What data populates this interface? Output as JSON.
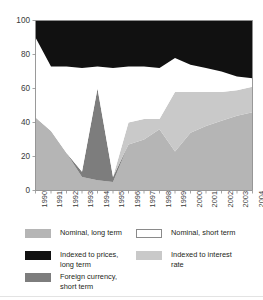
{
  "header": {
    "clipped_text": "Per cent"
  },
  "chart_data": {
    "type": "area",
    "stacked": true,
    "title": "",
    "xlabel": "",
    "ylabel": "",
    "ylim": [
      0,
      100
    ],
    "yticks": [
      0,
      20,
      40,
      60,
      80,
      100
    ],
    "grid": false,
    "legend_position": "bottom",
    "categories": [
      "1990",
      "1991",
      "1992",
      "1993",
      "1994",
      "1995",
      "1996",
      "1997",
      "1998",
      "1999",
      "2000",
      "2001",
      "2002",
      "2003",
      "2004"
    ],
    "series": [
      {
        "name": "Nominal, long term",
        "color": "#b5b5b5",
        "values": [
          43,
          35,
          22,
          8,
          6,
          5,
          27,
          30,
          36,
          23,
          34,
          38,
          41,
          44,
          46
        ]
      },
      {
        "name": "Foreign currency, short term",
        "color": "#7d7d7d",
        "values": [
          0,
          0,
          0,
          3,
          54,
          3,
          0,
          0,
          0,
          0,
          0,
          0,
          0,
          0,
          0
        ]
      },
      {
        "name": "Indexed to interest rate",
        "color": "#c9c9c9",
        "values": [
          0,
          0,
          0,
          0,
          0,
          0,
          13,
          12,
          6,
          35,
          24,
          20,
          17,
          15,
          15
        ]
      },
      {
        "name": "Nominal, short term",
        "color": "#ffffff",
        "values": [
          47,
          38,
          51,
          61,
          13,
          64,
          33,
          31,
          30,
          20,
          16,
          14,
          12,
          8,
          5
        ]
      },
      {
        "name": "Indexed to prices, long term",
        "color": "#111111",
        "values": [
          10,
          27,
          27,
          28,
          27,
          28,
          27,
          27,
          28,
          22,
          26,
          28,
          30,
          33,
          34
        ]
      }
    ]
  },
  "legend": {
    "items": [
      {
        "label": "Nominal, long term",
        "color": "#b5b5b5",
        "bordered": false,
        "col": 0,
        "row": 0
      },
      {
        "label": "Nominal, short term",
        "color": "#ffffff",
        "bordered": true,
        "col": 1,
        "row": 0
      },
      {
        "label": "Indexed to prices,\nlong term",
        "color": "#111111",
        "bordered": false,
        "col": 0,
        "row": 1
      },
      {
        "label": "Indexed to interest\nrate",
        "color": "#c9c9c9",
        "bordered": false,
        "col": 1,
        "row": 1
      },
      {
        "label": "Foreign currency,\nshort term",
        "color": "#7d7d7d",
        "bordered": false,
        "col": 0,
        "row": 2
      }
    ]
  },
  "axis": {
    "tick_color": "#9a9a9a",
    "frame_color": "#8f8f8f"
  }
}
